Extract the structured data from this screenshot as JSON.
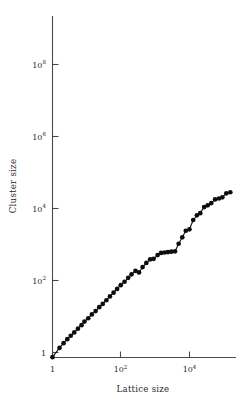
{
  "chart_data": {
    "type": "scatter",
    "title": "",
    "subtitle": "",
    "xlabel": "Lattice size",
    "ylabel": "Cluster size",
    "xscale": "log",
    "yscale": "log",
    "grid": false,
    "legend": "none",
    "connected": true,
    "marker": "filled-circle",
    "xlim": [
      1,
      300000
    ],
    "ylim": [
      0.45,
      1000000000
    ],
    "xticks": [
      1,
      100,
      10000
    ],
    "xtick_labels": [
      "1",
      "10²",
      "10⁴"
    ],
    "yticks": [
      1,
      100,
      10000,
      1000000,
      100000000
    ],
    "ytick_labels": [
      "1",
      "10²",
      "10⁴",
      "10⁶",
      "10⁸"
    ],
    "series": [
      {
        "name": "cluster size vs lattice size",
        "x": [
          1,
          1.6,
          2.1,
          2.7,
          3.4,
          4.3,
          5.5,
          7.0,
          8.5,
          11,
          14,
          18,
          23,
          29,
          37,
          47,
          60,
          76,
          97,
          125,
          160,
          200,
          260,
          330,
          420,
          540,
          700,
          880,
          1150,
          1450,
          1850,
          2300,
          2900,
          3700,
          4700,
          6000,
          7600,
          9700,
          12500,
          16000,
          20000,
          26000,
          33000,
          42000,
          54000,
          70000,
          88000,
          115000,
          150000
        ],
        "y": [
          0.55,
          1.8,
          3.3,
          5.5,
          8.5,
          13,
          21,
          33,
          52,
          80,
          130,
          200,
          330,
          500,
          800,
          1300,
          2100,
          3400,
          5500,
          8500,
          14000,
          22000,
          34000,
          28000,
          56000,
          95000,
          150000,
          160000,
          260000,
          340000,
          360000,
          380000,
          400000,
          420000,
          1100000,
          2500000,
          5800000,
          7000000,
          23000000,
          42000000,
          55000000,
          120000000,
          150000000,
          200000000,
          320000000,
          360000000,
          420000000,
          700000000,
          800000000
        ],
        "color": "#0d0d0d"
      }
    ],
    "annotations": []
  },
  "axes": {
    "y_title": "Cluster size",
    "x_title": "Lattice size",
    "x_tick_labels": [
      {
        "base": "1",
        "exp": ""
      },
      {
        "base": "10",
        "exp": "2"
      },
      {
        "base": "10",
        "exp": "4"
      }
    ],
    "y_tick_labels": [
      {
        "base": "1",
        "exp": ""
      },
      {
        "base": "10",
        "exp": "2"
      },
      {
        "base": "10",
        "exp": "4"
      },
      {
        "base": "10",
        "exp": "6"
      },
      {
        "base": "10",
        "exp": "8"
      }
    ]
  },
  "colors": {
    "background": "#ffffff",
    "axis": "#4a4a4a",
    "marker": "#0d0d0d",
    "line": "#111111",
    "text": "#2b2b2b"
  }
}
